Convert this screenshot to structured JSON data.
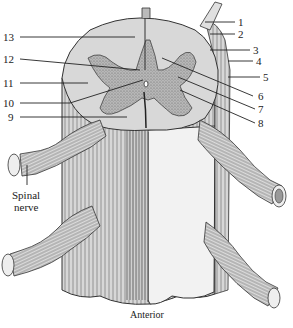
{
  "figure": {
    "orientation_caption": "Anterior",
    "spinal_nerve_label": [
      "Spinal",
      "nerve"
    ]
  },
  "labels_left": [
    {
      "number": "13",
      "y": 37
    },
    {
      "number": "12",
      "y": 59
    },
    {
      "number": "11",
      "y": 83
    },
    {
      "number": "10",
      "y": 103
    },
    {
      "number": "9",
      "y": 117
    }
  ],
  "labels_right": [
    {
      "number": "1",
      "y": 22
    },
    {
      "number": "2",
      "y": 34
    },
    {
      "number": "3",
      "y": 50
    },
    {
      "number": "4",
      "y": 61
    },
    {
      "number": "5",
      "y": 77
    },
    {
      "number": "6",
      "y": 96
    },
    {
      "number": "7",
      "y": 109
    },
    {
      "number": "8",
      "y": 123
    }
  ],
  "colors": {
    "white_matter": "#d8d8d8",
    "gray_matter": "#a8a8a8",
    "outline": "#333333",
    "meninges": "#bdbdbd",
    "background": "#ffffff"
  }
}
